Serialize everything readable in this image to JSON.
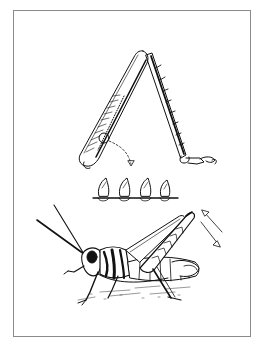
{
  "figure": {
    "panels": [
      {
        "id": "hind-leg",
        "label": ""
      },
      {
        "id": "stridulatory-pegs",
        "label": "",
        "peg_count": 4
      },
      {
        "id": "grasshopper",
        "label": ""
      }
    ]
  },
  "colors": {
    "ink": "#111111",
    "frame": "#8a8a8a",
    "background": "#ffffff"
  }
}
